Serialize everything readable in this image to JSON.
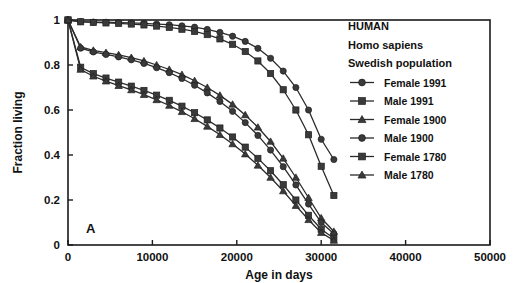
{
  "figure": {
    "panel_label": "A",
    "header_lines": [
      "HUMAN",
      "Homo sapiens",
      "Swedish population"
    ]
  },
  "chart_data": {
    "type": "line",
    "title": "HUMAN",
    "subtitle": "Homo sapiens",
    "note": "Swedish population",
    "panel": "A",
    "xlabel": "Age in days",
    "ylabel": "Fraction living",
    "xlim": [
      0,
      50000
    ],
    "ylim": [
      0,
      1
    ],
    "xticks": [
      0,
      10000,
      20000,
      30000,
      40000,
      50000
    ],
    "xtick_labels": [
      "0",
      "10000",
      "20000",
      "30000",
      "40000",
      "50000"
    ],
    "yticks": [
      0,
      0.2,
      0.4,
      0.6,
      0.8,
      1
    ],
    "ytick_labels": [
      "0",
      "0.2",
      "0.4",
      "0.6",
      "0.8",
      "1"
    ],
    "grid": false,
    "legend_position": "top-right",
    "marker_shapes": [
      "circle",
      "square",
      "triangle",
      "circle",
      "square",
      "triangle"
    ],
    "series": [
      {
        "name": "Female 1991",
        "marker": "circle",
        "x": [
          0,
          1500,
          3000,
          4500,
          6000,
          7500,
          9000,
          10500,
          12000,
          13500,
          15000,
          16500,
          18000,
          19500,
          21000,
          22500,
          24000,
          25500,
          27000,
          28500,
          30000,
          31500
        ],
        "y": [
          1.0,
          0.993,
          0.991,
          0.99,
          0.988,
          0.987,
          0.985,
          0.982,
          0.979,
          0.974,
          0.968,
          0.958,
          0.945,
          0.928,
          0.905,
          0.874,
          0.83,
          0.773,
          0.7,
          0.6,
          0.47,
          0.38
        ]
      },
      {
        "name": "Male 1991",
        "marker": "square",
        "x": [
          0,
          1500,
          3000,
          4500,
          6000,
          7500,
          9000,
          10500,
          12000,
          13500,
          15000,
          16500,
          18000,
          19500,
          21000,
          22500,
          24000,
          25500,
          27000,
          28500,
          30000,
          31500
        ],
        "y": [
          1.0,
          0.992,
          0.989,
          0.987,
          0.985,
          0.982,
          0.978,
          0.973,
          0.967,
          0.959,
          0.949,
          0.935,
          0.916,
          0.892,
          0.86,
          0.818,
          0.762,
          0.69,
          0.6,
          0.49,
          0.35,
          0.22
        ]
      },
      {
        "name": "Female 1900",
        "marker": "triangle",
        "x": [
          0,
          1500,
          3000,
          4500,
          6000,
          7500,
          9000,
          10500,
          12000,
          13500,
          15000,
          16500,
          18000,
          19500,
          21000,
          22500,
          24000,
          25500,
          27000,
          28500,
          30000,
          31500
        ],
        "y": [
          1.0,
          0.88,
          0.865,
          0.855,
          0.845,
          0.833,
          0.818,
          0.8,
          0.78,
          0.757,
          0.73,
          0.7,
          0.665,
          0.625,
          0.578,
          0.523,
          0.46,
          0.385,
          0.3,
          0.21,
          0.12,
          0.06
        ]
      },
      {
        "name": "Male 1900",
        "marker": "circle",
        "x": [
          0,
          1500,
          3000,
          4500,
          6000,
          7500,
          9000,
          10500,
          12000,
          13500,
          15000,
          16500,
          18000,
          19500,
          21000,
          22500,
          24000,
          25500,
          27000,
          28500,
          30000,
          31500
        ],
        "y": [
          1.0,
          0.875,
          0.858,
          0.847,
          0.836,
          0.823,
          0.807,
          0.788,
          0.766,
          0.74,
          0.71,
          0.676,
          0.638,
          0.594,
          0.544,
          0.487,
          0.422,
          0.348,
          0.267,
          0.182,
          0.1,
          0.05
        ]
      },
      {
        "name": "Female 1780",
        "marker": "square",
        "x": [
          0,
          1500,
          3000,
          4500,
          6000,
          7500,
          9000,
          10500,
          12000,
          13500,
          15000,
          16500,
          18000,
          19500,
          21000,
          22500,
          24000,
          25500,
          27000,
          28500,
          30000,
          31500
        ],
        "y": [
          1.0,
          0.79,
          0.762,
          0.742,
          0.724,
          0.706,
          0.687,
          0.666,
          0.643,
          0.617,
          0.588,
          0.556,
          0.52,
          0.48,
          0.435,
          0.385,
          0.33,
          0.268,
          0.2,
          0.132,
          0.07,
          0.03
        ]
      },
      {
        "name": "Male 1780",
        "marker": "triangle",
        "x": [
          0,
          1500,
          3000,
          4500,
          6000,
          7500,
          9000,
          10500,
          12000,
          13500,
          15000,
          16500,
          18000,
          19500,
          21000,
          22500,
          24000,
          25500,
          27000,
          28500,
          30000,
          31500
        ],
        "y": [
          1.0,
          0.78,
          0.75,
          0.728,
          0.708,
          0.689,
          0.668,
          0.645,
          0.62,
          0.592,
          0.561,
          0.527,
          0.49,
          0.449,
          0.404,
          0.354,
          0.3,
          0.24,
          0.175,
          0.112,
          0.055,
          0.02
        ]
      }
    ]
  }
}
